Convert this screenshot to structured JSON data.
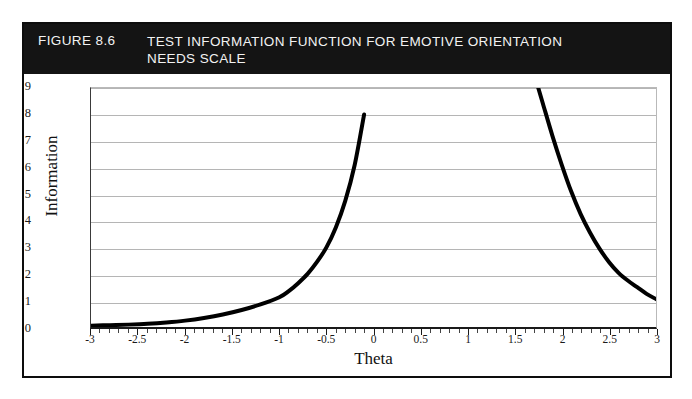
{
  "figure": {
    "number_label": "FIGURE 8.6",
    "title_line1": "TEST INFORMATION FUNCTION FOR EMOTIVE ORIENTATION",
    "title_line2": "NEEDS SCALE",
    "header_bg": "#141414",
    "header_text_color": "#f2f2f2",
    "border_color": "#0d0d0d"
  },
  "chart_data": {
    "type": "line",
    "title": "TEST INFORMATION FUNCTION FOR EMOTIVE ORIENTATION NEEDS SCALE",
    "xlabel": "Theta",
    "ylabel": "Information",
    "xlim": [
      -3,
      3
    ],
    "ylim": [
      0,
      9
    ],
    "grid": true,
    "legend": false,
    "line_color": "#000000",
    "line_width": 4,
    "grid_color": "#b5b5b5",
    "xticks": [
      -3,
      -2.5,
      -2,
      -1.5,
      -1,
      -0.5,
      0,
      0.5,
      1,
      1.5,
      2,
      2.5,
      3
    ],
    "xtick_labels": [
      "-3",
      "-2.5",
      "-2",
      "-1.5",
      "-1",
      "-0.5",
      "0",
      "0.5",
      "1",
      "1.5",
      "2",
      "2.5",
      "3"
    ],
    "yticks": [
      0,
      1,
      2,
      3,
      4,
      5,
      6,
      7,
      8,
      9
    ],
    "ytick_labels": [
      "0",
      "1",
      "2",
      "3",
      "4",
      "5",
      "6",
      "7",
      "8",
      "9"
    ],
    "series": [
      {
        "name": "Test Information",
        "note": "U-shaped curve; off-scale above Information = 9 between Theta -0.1 and 1.75",
        "x": [
          -3.0,
          -2.8,
          -2.6,
          -2.4,
          -2.2,
          -2.0,
          -1.8,
          -1.6,
          -1.4,
          -1.2,
          -1.0,
          -0.9,
          -0.8,
          -0.7,
          -0.6,
          -0.5,
          -0.4,
          -0.3,
          -0.2,
          -0.1,
          1.75,
          1.8,
          1.9,
          2.0,
          2.1,
          2.2,
          2.3,
          2.4,
          2.5,
          2.6,
          2.7,
          2.8,
          2.9,
          3.0
        ],
        "y": [
          0.05,
          0.07,
          0.09,
          0.12,
          0.17,
          0.24,
          0.34,
          0.47,
          0.64,
          0.85,
          1.12,
          1.35,
          1.65,
          2.0,
          2.45,
          3.0,
          3.75,
          4.75,
          6.1,
          8.0,
          9.0,
          8.4,
          7.2,
          6.1,
          5.1,
          4.25,
          3.55,
          2.95,
          2.45,
          2.05,
          1.75,
          1.5,
          1.25,
          1.05
        ]
      }
    ]
  }
}
